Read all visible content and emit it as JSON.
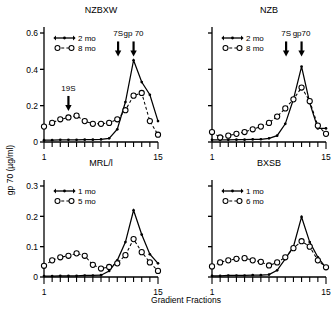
{
  "figure": {
    "y_axis_label": "gp 70 (µg/ml)",
    "x_axis_label": "Gradient Fractions"
  },
  "chart_data": [
    {
      "type": "line",
      "title": "NZBXW",
      "panel": "top-left",
      "xlabel": "Gradient Fractions",
      "ylabel": "gp 70 (µg/ml)",
      "xlim": [
        1,
        15
      ],
      "ylim": [
        0,
        0.6
      ],
      "xticks": [
        1,
        15
      ],
      "yticks": [
        0,
        0.2,
        0.4,
        0.6
      ],
      "ytick_labels": [
        "0",
        "0.2",
        "0.4",
        "0.6"
      ],
      "grid": false,
      "legend_position": "top-left",
      "annotations": [
        {
          "label": "19S",
          "x": 4.0,
          "y": 0.27
        },
        {
          "label": "7S",
          "x": 10.1,
          "y": 0.57
        },
        {
          "label": "gp 70",
          "x": 12.0,
          "y": 0.57
        }
      ],
      "series": [
        {
          "name": "2 mo",
          "style": "solid",
          "marker": "dot",
          "x": [
            1,
            2,
            3,
            4,
            5,
            6,
            7,
            8,
            9,
            10,
            11,
            12,
            13,
            14,
            15
          ],
          "values": [
            0.01,
            0.01,
            0.012,
            0.012,
            0.012,
            0.013,
            0.013,
            0.014,
            0.02,
            0.07,
            0.22,
            0.45,
            0.33,
            0.26,
            0.115
          ]
        },
        {
          "name": "8 mo",
          "style": "dashed",
          "marker": "circle",
          "x": [
            1,
            2,
            3,
            4,
            5,
            6,
            7,
            8,
            9,
            10,
            11,
            12,
            13,
            14,
            15
          ],
          "values": [
            0.085,
            0.105,
            0.125,
            0.135,
            0.145,
            0.115,
            0.1,
            0.1,
            0.105,
            0.125,
            0.175,
            0.255,
            0.27,
            0.115,
            0.04
          ]
        }
      ]
    },
    {
      "type": "line",
      "title": "NZB",
      "panel": "top-right",
      "xlabel": "Gradient Fractions",
      "ylabel": "gp 70 (µg/ml)",
      "xlim": [
        1,
        15
      ],
      "ylim": [
        0,
        0.6
      ],
      "xticks": [
        1,
        15
      ],
      "yticks": [
        0,
        0.2,
        0.4,
        0.6
      ],
      "ytick_labels": [
        "",
        "",
        "",
        ""
      ],
      "grid": false,
      "legend_position": "top-left",
      "annotations": [
        {
          "label": "7S",
          "x": 10.1,
          "y": 0.57
        },
        {
          "label": "gp70",
          "x": 12.0,
          "y": 0.57
        }
      ],
      "series": [
        {
          "name": "2 mo",
          "style": "solid",
          "marker": "dot",
          "x": [
            1,
            2,
            3,
            4,
            5,
            6,
            7,
            8,
            9,
            10,
            11,
            12,
            13,
            14,
            15
          ],
          "values": [
            0.012,
            0.012,
            0.012,
            0.013,
            0.013,
            0.014,
            0.015,
            0.02,
            0.035,
            0.1,
            0.235,
            0.415,
            0.215,
            0.075,
            0.075
          ]
        },
        {
          "name": "8 mo",
          "style": "dashed",
          "marker": "circle",
          "x": [
            1,
            2,
            3,
            4,
            5,
            6,
            7,
            8,
            9,
            10,
            11,
            12,
            13,
            14,
            15
          ],
          "values": [
            0.055,
            0.025,
            0.035,
            0.045,
            0.055,
            0.07,
            0.085,
            0.105,
            0.14,
            0.185,
            0.235,
            0.3,
            0.225,
            0.09,
            0.045
          ]
        }
      ]
    },
    {
      "type": "line",
      "title": "MRL/l",
      "panel": "bottom-left",
      "xlabel": "Gradient Fractions",
      "ylabel": "gp 70 (µg/ml)",
      "xlim": [
        1,
        15
      ],
      "ylim": [
        0,
        0.3
      ],
      "xticks": [
        1,
        15
      ],
      "yticks": [
        0,
        0.1,
        0.2,
        0.3
      ],
      "ytick_labels": [
        "0",
        "0.1",
        "0.2",
        "0.3"
      ],
      "grid": false,
      "legend_position": "top-left",
      "annotations": [],
      "series": [
        {
          "name": "1 mo",
          "style": "solid",
          "marker": "dot",
          "x": [
            1,
            2,
            3,
            4,
            5,
            6,
            7,
            8,
            9,
            10,
            11,
            12,
            13,
            14,
            15
          ],
          "values": [
            0.003,
            0.003,
            0.004,
            0.004,
            0.004,
            0.005,
            0.005,
            0.006,
            0.02,
            0.055,
            0.115,
            0.22,
            0.14,
            0.075,
            0.045
          ]
        },
        {
          "name": "5 mo",
          "style": "dashed",
          "marker": "circle",
          "x": [
            1,
            2,
            3,
            4,
            5,
            6,
            7,
            8,
            9,
            10,
            11,
            12,
            13,
            14,
            15
          ],
          "values": [
            0.037,
            0.055,
            0.065,
            0.07,
            0.078,
            0.07,
            0.04,
            0.028,
            0.033,
            0.045,
            0.072,
            0.125,
            0.082,
            0.048,
            0.02
          ]
        }
      ]
    },
    {
      "type": "line",
      "title": "BXSB",
      "panel": "bottom-right",
      "xlabel": "Gradient Fractions",
      "ylabel": "gp 70 (µg/ml)",
      "xlim": [
        1,
        15
      ],
      "ylim": [
        0,
        0.3
      ],
      "xticks": [
        1,
        15
      ],
      "yticks": [
        0,
        0.1,
        0.2,
        0.3
      ],
      "ytick_labels": [
        "",
        "",
        "",
        ""
      ],
      "grid": false,
      "legend_position": "top-left",
      "annotations": [],
      "series": [
        {
          "name": "1 mo",
          "style": "solid",
          "marker": "dot",
          "x": [
            1,
            2,
            3,
            4,
            5,
            6,
            7,
            8,
            9,
            10,
            11,
            12,
            13,
            14,
            15
          ],
          "values": [
            0.004,
            0.004,
            0.005,
            0.005,
            0.005,
            0.006,
            0.006,
            0.008,
            0.022,
            0.06,
            0.1,
            0.198,
            0.115,
            0.065,
            0.03
          ]
        },
        {
          "name": "6 mo",
          "style": "dashed",
          "marker": "circle",
          "x": [
            1,
            2,
            3,
            4,
            5,
            6,
            7,
            8,
            9,
            10,
            11,
            12,
            13,
            14,
            15
          ],
          "values": [
            0.035,
            0.048,
            0.055,
            0.06,
            0.062,
            0.055,
            0.05,
            0.038,
            0.048,
            0.065,
            0.095,
            0.118,
            0.1,
            0.055,
            0.032
          ]
        }
      ]
    }
  ]
}
